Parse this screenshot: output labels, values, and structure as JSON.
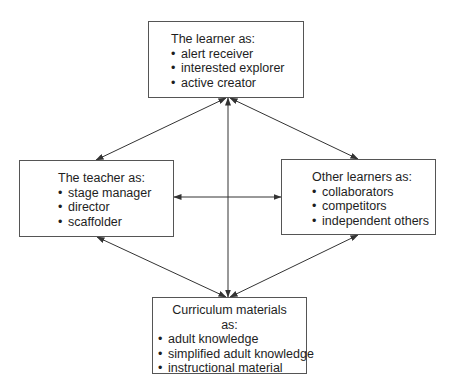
{
  "diagram": {
    "type": "relationship-diagram",
    "colors": {
      "line": "#333333",
      "border": "#555555",
      "text": "#1e1e1e"
    },
    "nodes": {
      "learner": {
        "title": "The learner as:",
        "items": [
          "alert receiver",
          "interested explorer",
          "active creator"
        ]
      },
      "teacher": {
        "title": "The teacher as:",
        "items": [
          "stage manager",
          "director",
          "scaffolder"
        ]
      },
      "others": {
        "title": "Other learners as:",
        "items": [
          "collaborators",
          "competitors",
          "independent others"
        ]
      },
      "curriculum": {
        "title_line1": "Curriculum materials",
        "title_line2": "as:",
        "items": [
          "adult knowledge",
          "simplified adult knowledge",
          "instructional material"
        ]
      }
    },
    "edges": [
      {
        "from": "learner",
        "to": "teacher",
        "bidirectional": true
      },
      {
        "from": "learner",
        "to": "others",
        "bidirectional": true
      },
      {
        "from": "learner",
        "to": "curriculum",
        "bidirectional": true
      },
      {
        "from": "teacher",
        "to": "others",
        "bidirectional": true
      },
      {
        "from": "teacher",
        "to": "curriculum",
        "bidirectional": true
      },
      {
        "from": "others",
        "to": "curriculum",
        "bidirectional": true
      }
    ]
  }
}
